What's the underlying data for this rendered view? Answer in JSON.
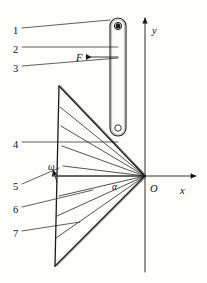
{
  "figure": {
    "kind": "mechanism-diagram",
    "width": 207,
    "height": 283,
    "background_color": "#fdfdfc",
    "line_color": "#1a1a1a",
    "labels": {
      "item1": "1",
      "item2": "2",
      "item3": "3",
      "item4": "4",
      "item5": "5",
      "item6": "6",
      "item7": "7",
      "force": "F",
      "omega": "ω",
      "alpha": "α",
      "origin": "O",
      "axis_x": "x",
      "axis_y": "y"
    },
    "callouts": [
      {
        "id": "1",
        "text": "1",
        "x": 13,
        "y": 26,
        "leader_from": [
          22,
          28
        ],
        "leader_to": [
          110,
          20
        ]
      },
      {
        "id": "2",
        "text": "2",
        "x": 13,
        "y": 45,
        "leader_from": [
          22,
          47
        ],
        "leader_to": [
          118,
          47
        ]
      },
      {
        "id": "3",
        "text": "3",
        "x": 13,
        "y": 64,
        "leader_from": [
          22,
          66
        ],
        "leader_to": [
          118,
          58
        ]
      },
      {
        "id": "4",
        "text": "4",
        "x": 13,
        "y": 140,
        "leader_from": [
          22,
          142
        ],
        "leader_to": [
          118,
          142
        ]
      },
      {
        "id": "5",
        "text": "5",
        "x": 13,
        "y": 182,
        "leader_from": [
          22,
          184
        ],
        "leader_to": [
          59,
          168
        ]
      },
      {
        "id": "6",
        "text": "6",
        "x": 13,
        "y": 205,
        "leader_from": [
          22,
          207
        ],
        "leader_to": [
          93,
          190
        ]
      },
      {
        "id": "7",
        "text": "7",
        "x": 13,
        "y": 229,
        "leader_from": [
          22,
          231
        ],
        "leader_to": [
          80,
          222
        ]
      }
    ],
    "axes": {
      "origin": [
        145,
        176
      ],
      "x_axis": {
        "from": [
          52,
          176
        ],
        "to": [
          196,
          176
        ],
        "arrow": "right",
        "label_pos": [
          180,
          186
        ]
      },
      "y_axis": {
        "from": [
          145,
          272
        ],
        "to": [
          145,
          18
        ],
        "arrow": "up",
        "label_pos": [
          152,
          26
        ]
      },
      "origin_label_pos": [
        150,
        184
      ]
    },
    "bar": {
      "x": 110,
      "y": 18,
      "width": 16,
      "height": 118,
      "corner_radius": 8,
      "top_pin": {
        "cx": 118,
        "cy": 26,
        "r": 3.6
      },
      "bottom_pin": {
        "cx": 118,
        "cy": 128,
        "r": 3.2
      }
    },
    "force_arrow": {
      "label_pos": [
        76,
        53
      ],
      "from": [
        118,
        57
      ],
      "to": [
        86,
        57
      ],
      "direction": "left"
    },
    "fan": {
      "apex": [
        145,
        176
      ],
      "top_vertex": [
        59,
        86
      ],
      "bottom_vertex": [
        55,
        266
      ],
      "ray_endpoints": [
        [
          59,
          86
        ],
        [
          60,
          107
        ],
        [
          61,
          126
        ],
        [
          62,
          146
        ],
        [
          63,
          166
        ],
        [
          58,
          176
        ],
        [
          59,
          196
        ],
        [
          57,
          216
        ],
        [
          56,
          238
        ],
        [
          55,
          266
        ]
      ],
      "left_edge": {
        "from": [
          59,
          86
        ],
        "to": [
          55,
          266
        ]
      }
    },
    "omega_marker": {
      "label_pos": [
        48,
        163
      ],
      "arrow_from": [
        57,
        182
      ],
      "arrow_to": [
        53,
        170
      ]
    },
    "alpha_marker": {
      "label_pos": [
        112,
        183
      ]
    }
  }
}
